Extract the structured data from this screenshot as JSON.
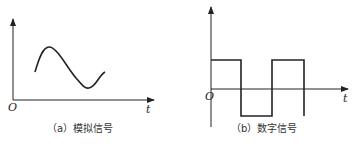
{
  "panels": [
    {
      "id": "a",
      "caption": "（a）模拟信号",
      "origin_label": "O",
      "axis_label": "t",
      "signal_type": "analog",
      "curve_points": [
        [
          35,
          72
        ],
        [
          48,
          47
        ],
        [
          88,
          88
        ],
        [
          105,
          72
        ]
      ]
    },
    {
      "id": "b",
      "caption": "（b）数字信号",
      "origin_label": "O",
      "axis_label": "t",
      "signal_type": "digital",
      "levels": [
        "high",
        "low",
        "high",
        "low"
      ]
    }
  ],
  "colors": {
    "stroke": "#222222",
    "text": "#333333"
  }
}
